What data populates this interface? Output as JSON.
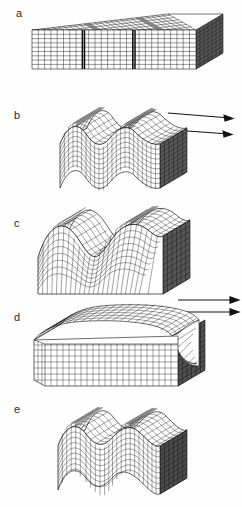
{
  "figure": {
    "kind": "finite-element block diagram sequence",
    "background_color": "#ffffff",
    "ink_color": "#1a1a1a",
    "shade_color": "#6f6f6f",
    "dark_face_color": "#3d3d3d",
    "panel_count": 5
  },
  "panels": [
    {
      "label": "a",
      "label_x": 16,
      "label_y": 8,
      "top": 0,
      "height": 100,
      "description": "undeformed rectangular block with regular orthogonal mesh, isometric view, dark shaded right end face",
      "geometry": {
        "type": "block",
        "amplitude": 0,
        "wavelength": 0,
        "mesh_cols": 26,
        "mesh_rows": 9,
        "end_face_shaded": true,
        "marker_bands": [
          8,
          16
        ]
      }
    },
    {
      "label": "b",
      "label_x": 14,
      "label_y": 110,
      "top": 100,
      "height": 100,
      "description": "gently folded block, two full sinusoidal waves, flat base, dark shaded right end face",
      "geometry": {
        "type": "folded-block",
        "amplitude": 13,
        "wavelength": 88,
        "mesh_cols": 24,
        "mesh_rows": 9,
        "end_face_shaded": true,
        "base_wavy": true
      }
    },
    {
      "label": "c",
      "label_x": 14,
      "label_y": 218,
      "top": 200,
      "height": 98,
      "description": "strongly folded block with rounded dome crests and flat horizontal base, mesh stretched over hinges",
      "geometry": {
        "type": "folded-block",
        "amplitude": 22,
        "wavelength": 86,
        "mesh_cols": 24,
        "mesh_rows": 9,
        "end_face_shaded": true,
        "base_wavy": false
      }
    },
    {
      "label": "d",
      "label_x": 14,
      "label_y": 312,
      "top": 298,
      "height": 100,
      "description": "flat-topped slab with thin deformed cover layer, large rolled-over fold at right end, box-like body",
      "geometry": {
        "type": "slab-with-cover",
        "amplitude": 5,
        "wavelength": 120,
        "mesh_cols": 22,
        "mesh_rows": 8,
        "end_face_shaded": true,
        "base_wavy": false
      }
    },
    {
      "label": "e",
      "label_x": 14,
      "label_y": 404,
      "top": 398,
      "height": 109,
      "description": "folded block with two sinusoidal waves and wavy base, dark shaded right end face",
      "geometry": {
        "type": "folded-block",
        "amplitude": 15,
        "wavelength": 88,
        "mesh_cols": 24,
        "mesh_rows": 9,
        "end_face_shaded": true,
        "base_wavy": true
      }
    }
  ],
  "arrow_groups": [
    {
      "between": "a-b",
      "top": 100,
      "direction": "right",
      "arrows": [
        {
          "x1": 168,
          "y1": 13,
          "x2": 233,
          "y2": 18
        },
        {
          "x1": 160,
          "y1": 29,
          "x2": 232,
          "y2": 34
        }
      ]
    },
    {
      "between": "c-d",
      "top": 292,
      "direction": "right",
      "arrows": [
        {
          "x1": 178,
          "y1": 8,
          "x2": 239,
          "y2": 8
        },
        {
          "x1": 178,
          "y1": 20,
          "x2": 239,
          "y2": 20
        }
      ]
    }
  ]
}
